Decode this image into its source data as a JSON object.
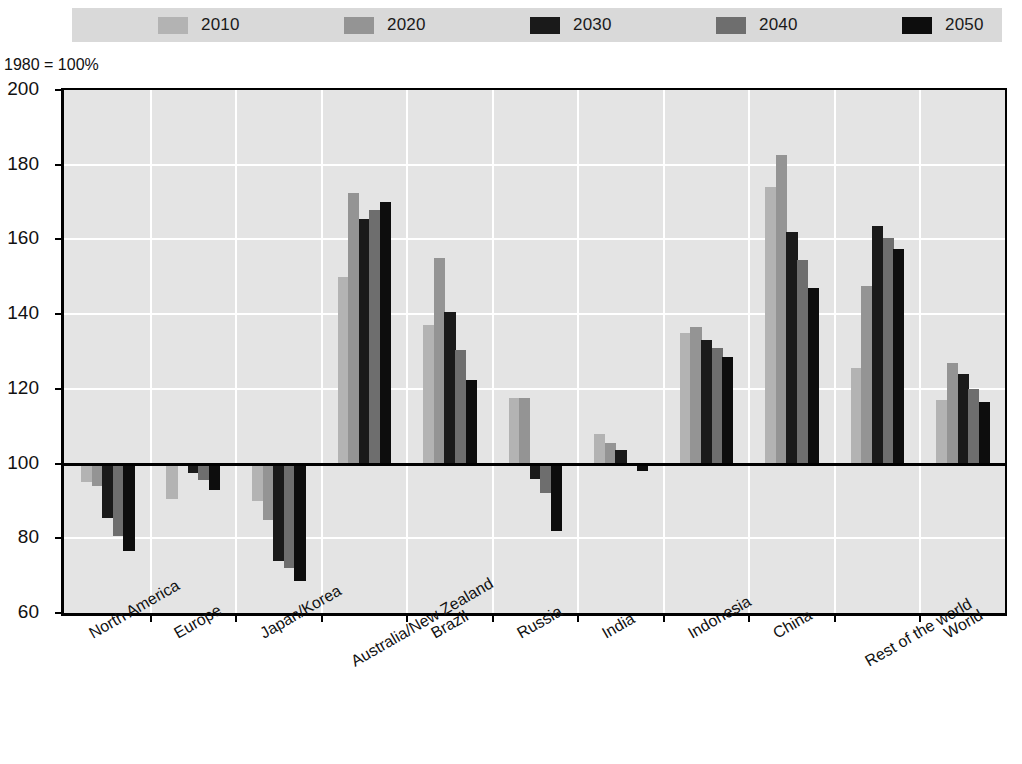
{
  "axis_note": "1980 = 100%",
  "legend": {
    "items": [
      {
        "label": "2010",
        "color": "#b3b3b3"
      },
      {
        "label": "2020",
        "color": "#949494"
      },
      {
        "label": "2030",
        "color": "#1a1a1a"
      },
      {
        "label": "2040",
        "color": "#6e6e6e"
      },
      {
        "label": "2050",
        "color": "#0d0d0d"
      }
    ]
  },
  "chart_data": {
    "type": "bar",
    "title": "",
    "subtitle": "",
    "xlabel": "",
    "ylabel": "",
    "note": "1980 = 100%",
    "ylim": [
      60,
      200
    ],
    "yticks": [
      60,
      80,
      100,
      120,
      140,
      160,
      180,
      200
    ],
    "ytick_labels": [
      "60",
      "80",
      "100",
      "120",
      "140",
      "160",
      "180",
      "200"
    ],
    "baseline": 100,
    "grid": true,
    "legend_position": "top",
    "categories": [
      "North America",
      "Europe",
      "Japan/Korea",
      "Australia/New Zealand",
      "Brazil",
      "Russia",
      "India",
      "Indonesia",
      "China",
      "Rest of the world",
      "World"
    ],
    "series": [
      {
        "name": "2010",
        "color": "#b3b3b3",
        "values": [
          95.0,
          90.5,
          90.0,
          150.0,
          137.0,
          117.5,
          108.0,
          135.0,
          174.0,
          125.5,
          117.0
        ]
      },
      {
        "name": "2020",
        "color": "#949494",
        "values": [
          94.0,
          99.5,
          85.0,
          172.5,
          155.0,
          117.5,
          105.5,
          136.5,
          182.5,
          147.5,
          127.0
        ]
      },
      {
        "name": "2030",
        "color": "#1a1a1a",
        "values": [
          85.5,
          97.5,
          74.0,
          165.5,
          140.5,
          96.0,
          103.5,
          133.0,
          162.0,
          163.5,
          124.0
        ]
      },
      {
        "name": "2040",
        "color": "#6e6e6e",
        "values": [
          80.5,
          95.5,
          72.0,
          168.0,
          130.5,
          92.0,
          100.0,
          131.0,
          154.5,
          160.5,
          120.0
        ]
      },
      {
        "name": "2050",
        "color": "#0d0d0d",
        "values": [
          76.5,
          93.0,
          68.5,
          170.0,
          122.5,
          82.0,
          98.0,
          128.5,
          147.0,
          157.5,
          116.5
        ]
      }
    ]
  }
}
